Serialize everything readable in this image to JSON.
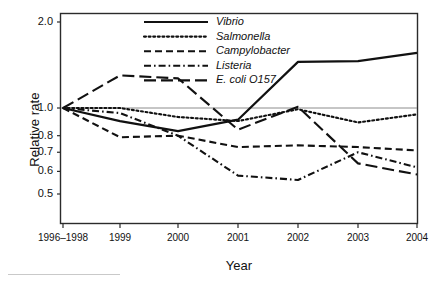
{
  "chart_data": {
    "type": "line",
    "title": "",
    "xlabel": "Year",
    "ylabel": "Relative rate",
    "yscale": "log",
    "ylim": [
      0.45,
      2.1
    ],
    "grid": false,
    "reference_line": 1.0,
    "legend_position": "top-center-inside",
    "categories": [
      "1996–1998",
      "1999",
      "2000",
      "2001",
      "2002",
      "2003",
      "2004"
    ],
    "yticks": [
      2.0,
      1.0,
      0.8,
      0.7,
      0.6,
      0.5
    ],
    "ytick_labels": [
      "2.0",
      "1.0",
      "0.8",
      "0.7",
      "0.6",
      "0.5"
    ],
    "series": [
      {
        "name": "Vibrio",
        "style": "solid",
        "values": [
          1.0,
          0.9,
          0.83,
          0.91,
          1.45,
          1.46,
          1.56
        ]
      },
      {
        "name": "Salmonella",
        "style": "dotted",
        "values": [
          1.0,
          1.0,
          0.93,
          0.9,
          0.99,
          0.89,
          0.95
        ]
      },
      {
        "name": "Campylobacter",
        "style": "dashed",
        "values": [
          1.0,
          0.79,
          0.8,
          0.73,
          0.74,
          0.73,
          0.71
        ]
      },
      {
        "name": "Listeria",
        "style": "dash-dot",
        "values": [
          1.0,
          0.96,
          0.8,
          0.58,
          0.56,
          0.7,
          0.62
        ]
      },
      {
        "name": "E. coli O157",
        "style": "long-dashed",
        "values": [
          1.0,
          1.3,
          1.27,
          0.84,
          1.01,
          0.64,
          0.585
        ]
      }
    ]
  },
  "axes": {
    "y_title": "Relative rate",
    "x_title": "Year"
  }
}
